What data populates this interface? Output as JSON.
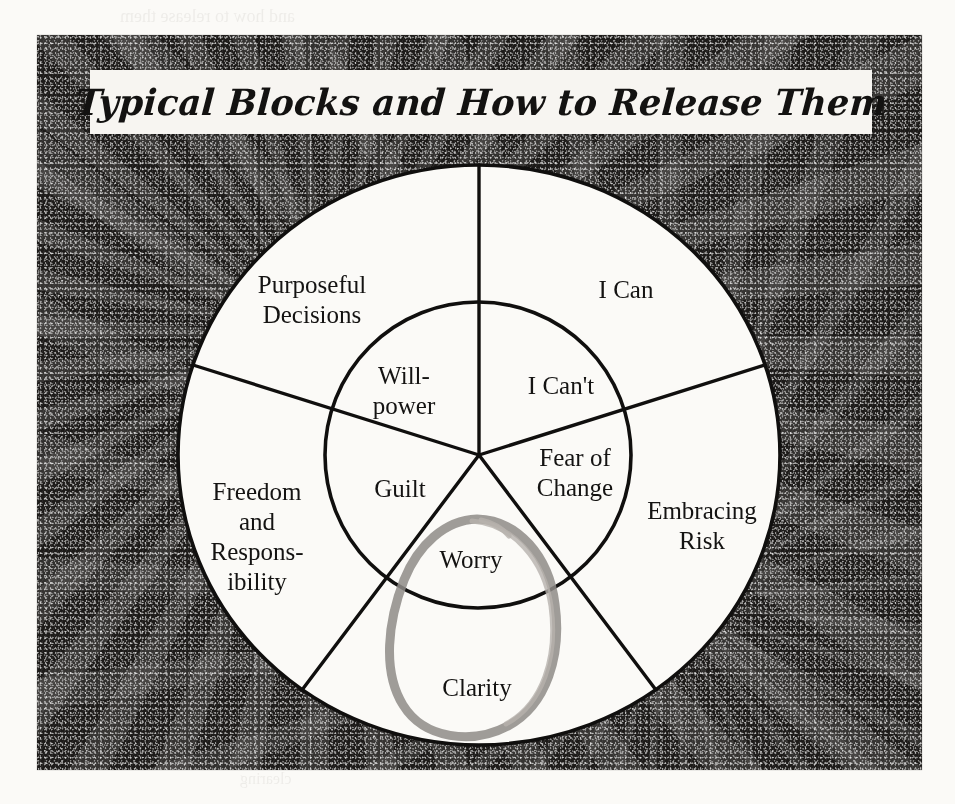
{
  "document": {
    "title": "Typical Blocks and How to Release Them",
    "frame_color": "#1d1b19",
    "paper_color": "#fbfaf7",
    "ink_color": "#141312",
    "pencil_color": "#8e8b87"
  },
  "diagram": {
    "type": "concentric-wheel",
    "sectors": 5,
    "center": {
      "x": 479,
      "y": 455
    },
    "outer_radius_x": 301,
    "outer_radius_y": 290,
    "inner_radius": 153,
    "start_angle_deg": -90,
    "segments": [
      {
        "index": 0,
        "angle_mid_deg": -54,
        "inner_label": "I Can't",
        "outer_label": "I Can"
      },
      {
        "index": 1,
        "angle_mid_deg": 18,
        "inner_label": "Fear of\nChange",
        "outer_label": "Embracing\nRisk"
      },
      {
        "index": 2,
        "angle_mid_deg": 90,
        "inner_label": "Worry",
        "outer_label": "Clarity"
      },
      {
        "index": 3,
        "angle_mid_deg": 162,
        "inner_label": "Guilt",
        "outer_label": "Freedom\nand\nRespons-\nibility"
      },
      {
        "index": 4,
        "angle_mid_deg": 234,
        "inner_label": "Will-\npower",
        "outer_label": "Purposeful\nDecisions"
      }
    ],
    "inner_labels": [
      {
        "name": "i-cant",
        "lines": [
          "I Can't"
        ],
        "x": 561,
        "y": 385
      },
      {
        "name": "fear-of-change",
        "lines": [
          "Fear of",
          "Change"
        ],
        "x": 573,
        "y": 473
      },
      {
        "name": "worry",
        "lines": [
          "Worry"
        ],
        "x": 471,
        "y": 560
      },
      {
        "name": "guilt",
        "lines": [
          "Guilt"
        ],
        "x": 400,
        "y": 488
      },
      {
        "name": "willpower",
        "lines": [
          "Will-",
          "power"
        ],
        "x": 403,
        "y": 375
      }
    ],
    "outer_labels": [
      {
        "name": "i-can",
        "lines": [
          "I Can"
        ],
        "x": 625,
        "y": 289
      },
      {
        "name": "embracing-risk",
        "lines": [
          "Embracing",
          "Risk"
        ],
        "x": 700,
        "y": 526
      },
      {
        "name": "clarity",
        "lines": [
          "Clarity"
        ],
        "x": 477,
        "y": 688
      },
      {
        "name": "freedom-and-responsibility",
        "lines": [
          "Freedom",
          "and",
          "Respons-",
          "ibility"
        ],
        "x": 256,
        "y": 501
      },
      {
        "name": "purposeful-decisions",
        "lines": [
          "Purposeful",
          "Decisions"
        ],
        "x": 311,
        "y": 291
      }
    ],
    "annotation": {
      "name": "pencil-circle-annotation",
      "shape": "hand-drawn egg oval",
      "encircles": [
        "Worry",
        "Clarity"
      ],
      "color": "#8e8b87"
    }
  },
  "bleed_through": {
    "note": "faint mirrored text showing through from the reverse side of the page",
    "lines": [
      {
        "text": "and how to release them",
        "x": 120,
        "y": 6,
        "size": 18
      },
      {
        "text": "a moment",
        "x": 660,
        "y": 205,
        "size": 16
      },
      {
        "text": "responsibility",
        "x": 600,
        "y": 352,
        "size": 17
      },
      {
        "text": "and freedom",
        "x": 560,
        "y": 468,
        "size": 17
      },
      {
        "text": "everything",
        "x": 560,
        "y": 640,
        "size": 17
      },
      {
        "text": "from your",
        "x": 610,
        "y": 700,
        "size": 17
      },
      {
        "text": "clearing",
        "x": 240,
        "y": 770,
        "size": 16
      }
    ]
  }
}
